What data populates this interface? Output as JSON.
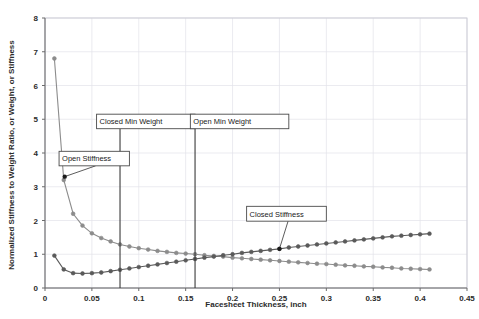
{
  "chart_data": {
    "type": "line",
    "title": "",
    "xlabel": "Facesheet Thickness, inch",
    "ylabel": "Normalized Stiffness to Weight Ratio, or Weight, or Stiffness",
    "xlim": [
      0,
      0.45
    ],
    "ylim": [
      0,
      8
    ],
    "xticks": [
      "0",
      "0.05",
      "0.1",
      "0.15",
      "0.2",
      "0.25",
      "0.3",
      "0.35",
      "0.4",
      "0.45"
    ],
    "xtick_values": [
      0,
      0.05,
      0.1,
      0.15,
      0.2,
      0.25,
      0.3,
      0.35,
      0.4,
      0.45
    ],
    "yticks": [
      "0",
      "1",
      "2",
      "3",
      "4",
      "5",
      "6",
      "7",
      "8"
    ],
    "ytick_values": [
      0,
      1,
      2,
      3,
      4,
      5,
      6,
      7,
      8
    ],
    "grid": true,
    "legend": "none",
    "series": [
      {
        "name": "Open Stiffness",
        "color": "#8c8c8c",
        "marker": "circle",
        "x": [
          0.01,
          0.02,
          0.03,
          0.04,
          0.05,
          0.06,
          0.07,
          0.08,
          0.09,
          0.1,
          0.11,
          0.12,
          0.13,
          0.14,
          0.15,
          0.16,
          0.17,
          0.18,
          0.19,
          0.2,
          0.21,
          0.22,
          0.23,
          0.24,
          0.25,
          0.26,
          0.27,
          0.28,
          0.29,
          0.3,
          0.31,
          0.32,
          0.33,
          0.34,
          0.35,
          0.36,
          0.37,
          0.38,
          0.39,
          0.4,
          0.41
        ],
        "y": [
          6.8,
          3.2,
          2.2,
          1.85,
          1.62,
          1.48,
          1.38,
          1.29,
          1.23,
          1.18,
          1.14,
          1.1,
          1.07,
          1.04,
          1.02,
          1.0,
          0.97,
          0.95,
          0.93,
          0.9,
          0.88,
          0.86,
          0.84,
          0.82,
          0.8,
          0.78,
          0.76,
          0.74,
          0.72,
          0.71,
          0.69,
          0.67,
          0.66,
          0.64,
          0.63,
          0.61,
          0.6,
          0.58,
          0.57,
          0.56,
          0.55
        ]
      },
      {
        "name": "Closed Stiffness",
        "color": "#5a5a5a",
        "marker": "circle",
        "x": [
          0.01,
          0.02,
          0.03,
          0.04,
          0.05,
          0.06,
          0.07,
          0.08,
          0.09,
          0.1,
          0.11,
          0.12,
          0.13,
          0.14,
          0.15,
          0.16,
          0.17,
          0.18,
          0.19,
          0.2,
          0.21,
          0.22,
          0.23,
          0.24,
          0.25,
          0.26,
          0.27,
          0.28,
          0.29,
          0.3,
          0.31,
          0.32,
          0.33,
          0.34,
          0.35,
          0.36,
          0.37,
          0.38,
          0.39,
          0.4,
          0.41
        ],
        "y": [
          0.96,
          0.55,
          0.44,
          0.43,
          0.44,
          0.46,
          0.5,
          0.54,
          0.58,
          0.62,
          0.66,
          0.7,
          0.74,
          0.78,
          0.82,
          0.86,
          0.9,
          0.93,
          0.97,
          1.0,
          1.04,
          1.07,
          1.1,
          1.13,
          1.16,
          1.2,
          1.23,
          1.26,
          1.29,
          1.32,
          1.35,
          1.38,
          1.41,
          1.44,
          1.47,
          1.5,
          1.53,
          1.55,
          1.57,
          1.59,
          1.61
        ]
      }
    ],
    "vertical_markers": [
      {
        "label": "Closed Min Weight",
        "x": 0.08,
        "y_top": 4.72,
        "y_bottom": 0.0
      },
      {
        "label": "Open Min Weight",
        "x": 0.16,
        "y_top": 4.72,
        "y_bottom": 0.0
      }
    ],
    "annotations": [
      {
        "label": "Closed Min Weight",
        "box": {
          "x": 0.055,
          "y_top": 5.15,
          "y_bottom": 4.72,
          "width": 0.105
        }
      },
      {
        "label": "Open Min Weight",
        "box": {
          "x": 0.155,
          "y_top": 5.15,
          "y_bottom": 4.72,
          "width": 0.105
        }
      },
      {
        "label": "Open Stiffness",
        "box": {
          "x": 0.015,
          "y_top": 4.05,
          "y_bottom": 3.62,
          "width": 0.075
        },
        "points_to": {
          "x": 0.021,
          "y": 3.3
        }
      },
      {
        "label": "Closed Stiffness",
        "box": {
          "x": 0.215,
          "y_top": 2.42,
          "y_bottom": 1.98,
          "width": 0.085
        },
        "points_to": {
          "x": 0.25,
          "y": 1.16
        }
      }
    ]
  },
  "colors": {
    "open_series": "#8c8c8c",
    "closed_series": "#5a5a5a",
    "grid": "#e2e2ea",
    "axis": "#6b6b6b",
    "marker_line": "#3a3a3a",
    "text": "#2b2b2b",
    "background": "#ffffff"
  }
}
